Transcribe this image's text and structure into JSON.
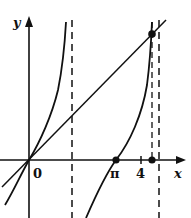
{
  "diagram": {
    "axes": {
      "x_label": "x",
      "y_label": "y",
      "origin_label": "0"
    },
    "tick_labels": {
      "pi": "π",
      "four": "4"
    },
    "curves": [
      {
        "name": "y = tan x",
        "style": "solid"
      },
      {
        "name": "y = x",
        "style": "solid"
      }
    ],
    "asymptotes": [
      {
        "x": "π/2",
        "style": "dashed"
      },
      {
        "x": "3π/2",
        "style": "dashed"
      },
      {
        "x": "root",
        "style": "dashed"
      }
    ],
    "points": [
      {
        "label": "origin",
        "x": 0,
        "y": 0
      },
      {
        "label": "π",
        "x": 3.14159,
        "y": 0
      },
      {
        "label": "root on x-axis",
        "x": 4.49,
        "y": 0
      },
      {
        "label": "intersection tan x = x",
        "x": 4.49,
        "y": 4.49
      }
    ],
    "colors": {
      "stroke": "#111111",
      "background": "#ffffff"
    }
  }
}
